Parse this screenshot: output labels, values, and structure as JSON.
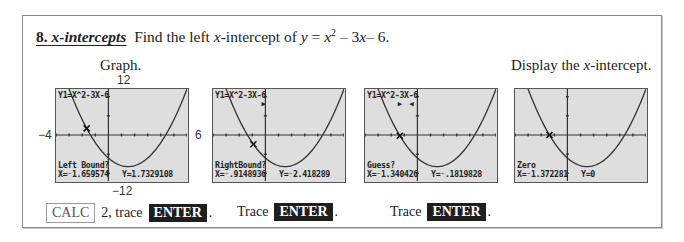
{
  "section": {
    "number": "8.",
    "heading": "x-intercepts",
    "instruction_prefix": "Find the left ",
    "instruction_var": "x",
    "instruction_mid": "-intercept of ",
    "equation_y": "y",
    "equation_eq": " = ",
    "equation_x": "x",
    "equation_exp": "2",
    "equation_rest_a": " – 3",
    "equation_rest_x": "x",
    "equation_rest_b": "– 6."
  },
  "labels": {
    "graph": "Graph.",
    "display_prefix": "Display the ",
    "display_var": "x",
    "display_suffix": "-intercept."
  },
  "window": {
    "xmin_label": "−4",
    "xmax_label": "6",
    "ymax_label": "12",
    "ymin_label": "−12",
    "xmin": -4,
    "xmax": 6,
    "ymin": -12,
    "ymax": 12,
    "xscl": 1,
    "yscl": 1
  },
  "function": {
    "expr": "Y1=X^2-3X-6",
    "a": 1,
    "b": -3,
    "c": -6
  },
  "screens": [
    {
      "name": "left-bound",
      "show_expr": true,
      "prompt": "Left Bound?",
      "x_readout": "X=⁻1.659574",
      "y_readout": "Y=1.7329108",
      "cursor_x": -1.659574,
      "cursor_y": 1.7329108,
      "markers": []
    },
    {
      "name": "right-bound",
      "show_expr": true,
      "prompt": "RightBound?",
      "x_readout": "X=⁻.9148936",
      "y_readout": "Y=⁻2.418289",
      "cursor_x": -0.9148936,
      "cursor_y": -2.418289,
      "markers": [
        "▶"
      ]
    },
    {
      "name": "guess",
      "show_expr": true,
      "prompt": "Guess?",
      "x_readout": "X=⁻1.340426",
      "y_readout": "Y=⁻.1819828",
      "cursor_x": -1.340426,
      "cursor_y": -0.1819828,
      "markers": [
        "▶",
        "◀"
      ]
    },
    {
      "name": "zero",
      "show_expr": false,
      "prompt": "Zero",
      "x_readout": "X=⁻1.372281",
      "y_readout": "Y=0",
      "cursor_x": -1.372281,
      "cursor_y": 0,
      "markers": []
    }
  ],
  "keystrokes": [
    {
      "pre_key": "CALC",
      "text": "2, trace",
      "enter": "ENTER",
      "end": "."
    },
    {
      "text": "Trace",
      "enter": "ENTER",
      "end": "."
    },
    {
      "text": "Trace",
      "enter": "ENTER",
      "end": "."
    }
  ]
}
